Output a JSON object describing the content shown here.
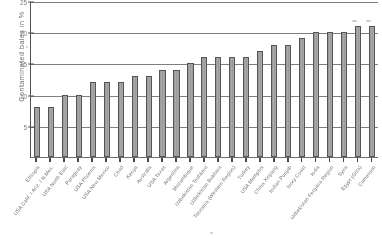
{
  "chart_data": {
    "type": "bar",
    "title": "",
    "subtitle": "",
    "xlabel": "",
    "ylabel": "Contaminated bales in %",
    "ylim": [
      0,
      25
    ],
    "yticks": [
      5,
      10,
      15,
      20,
      25
    ],
    "ytick_labels": [
      "5",
      "10",
      "15",
      "20",
      "25"
    ],
    "grid": true,
    "legend": "none",
    "bar_color": "#a0a0a0",
    "bar_edge_color": "#4f4f4f",
    "axis_color": "#4a4a4a",
    "categories": [
      "Ethiopia",
      "USA Calif. / Ariz. / N.Mex.",
      "USA North East",
      "Paraguay",
      "USA Phoenix",
      "USA New Mexico",
      "Chad",
      "Kenya",
      "Australia",
      "USA Texas",
      "Argentina",
      "Mozambique",
      "Uzbekistan Tashkent",
      "Uzbekistan Bukhara",
      "Tanzania (Western Region)",
      "Turkey",
      "USA Memphis",
      "China Xinjiang",
      "Indian Punjab",
      "Ivory Coast",
      "India",
      "Uzbekistan Fergana Region",
      "Syria",
      "Egypt (Giza)",
      "Cameroon"
    ],
    "values": [
      8,
      8,
      10,
      10,
      12,
      12,
      12,
      13,
      13,
      14,
      14,
      15,
      16,
      16,
      16,
      16,
      17,
      18,
      18,
      19,
      20,
      20,
      20,
      21,
      21
    ]
  }
}
